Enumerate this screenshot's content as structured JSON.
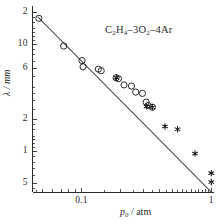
{
  "chart_data": {
    "type": "scatter",
    "title": "",
    "annotation": "C₂H₄–3O₂–4Ar",
    "xlabel": "p₀ / atm",
    "ylabel": "λ / mm",
    "xscale": "log",
    "yscale": "log",
    "xlim": [
      0.042,
      1.05
    ],
    "ylim": [
      0.42,
      21.5
    ],
    "grid": false,
    "legend": "none",
    "x_tick_labels": [
      {
        "value": 0.1,
        "label": "0.1"
      },
      {
        "value": 1.0,
        "label": "1"
      }
    ],
    "x_minor_ticks": [
      0.05,
      0.06,
      0.07,
      0.08,
      0.09,
      0.1,
      0.2,
      0.3,
      0.4,
      0.5,
      0.6,
      0.7,
      0.8,
      0.9,
      1.0
    ],
    "y_tick_labels": [
      {
        "value": 20,
        "label": "2"
      },
      {
        "value": 10,
        "label": "10"
      },
      {
        "value": 6,
        "label": "6"
      },
      {
        "value": 2,
        "label": "2"
      },
      {
        "value": 1,
        "label": "1"
      },
      {
        "value": 0.5,
        "label": "5"
      }
    ],
    "y_minor_ticks": [
      20,
      10,
      9,
      8,
      7,
      6,
      5,
      4,
      3,
      2,
      1,
      0.9,
      0.8,
      0.7,
      0.6,
      0.5
    ],
    "series": [
      {
        "name": "open-circles",
        "marker": "open-circle",
        "color": "#2b2b2b",
        "points": [
          {
            "x": 0.047,
            "y": 17.6
          },
          {
            "x": 0.073,
            "y": 9.7
          },
          {
            "x": 0.101,
            "y": 7.1
          },
          {
            "x": 0.103,
            "y": 6.2
          },
          {
            "x": 0.135,
            "y": 5.9
          },
          {
            "x": 0.142,
            "y": 5.7
          },
          {
            "x": 0.185,
            "y": 4.9
          },
          {
            "x": 0.193,
            "y": 4.8
          },
          {
            "x": 0.213,
            "y": 4.2
          },
          {
            "x": 0.243,
            "y": 4.1
          },
          {
            "x": 0.262,
            "y": 3.6
          },
          {
            "x": 0.295,
            "y": 3.5
          },
          {
            "x": 0.315,
            "y": 2.9
          },
          {
            "x": 0.327,
            "y": 2.7
          },
          {
            "x": 0.352,
            "y": 2.6
          }
        ]
      },
      {
        "name": "star-markers",
        "marker": "six-point-star",
        "color": "#1a1a1a",
        "points": [
          {
            "x": 0.186,
            "y": 4.9
          },
          {
            "x": 0.318,
            "y": 2.65
          },
          {
            "x": 0.352,
            "y": 2.6
          },
          {
            "x": 0.44,
            "y": 1.72
          },
          {
            "x": 0.55,
            "y": 1.62
          },
          {
            "x": 0.75,
            "y": 0.96
          },
          {
            "x": 1.0,
            "y": 0.63
          },
          {
            "x": 1.0,
            "y": 0.52
          }
        ]
      }
    ],
    "fit_line": {
      "name": "power-law-fit",
      "x_start": 0.046,
      "y_start": 18.2,
      "x_end": 1.0,
      "y_end": 0.42,
      "color": "#2b2b2b"
    }
  },
  "axes": {
    "x_title": "p",
    "x_title_sub": "0",
    "x_title_unit": " / atm",
    "y_title": "λ / mm"
  },
  "annotation": {
    "formula_part1": "C",
    "formula_sub1": "2",
    "formula_part2": "H",
    "formula_sub2": "4",
    "formula_part3": "–3O",
    "formula_sub3": "2",
    "formula_part4": "–4Ar"
  }
}
